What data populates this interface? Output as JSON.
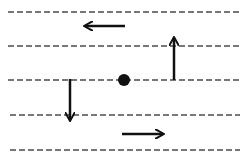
{
  "diagram": {
    "lines": [
      {
        "y": 12,
        "x1": 8,
        "x2": 240
      },
      {
        "y": 46,
        "x1": 8,
        "x2": 240
      },
      {
        "y": 80,
        "x1": 8,
        "x2": 240
      },
      {
        "y": 115,
        "x1": 10,
        "x2": 240
      },
      {
        "y": 150,
        "x1": 10,
        "x2": 240
      }
    ],
    "arrows": [
      {
        "direction": "left",
        "x1": 125,
        "y1": 26,
        "x2": 85,
        "y2": 26
      },
      {
        "direction": "up",
        "x1": 174,
        "y1": 80,
        "x2": 174,
        "y2": 38
      },
      {
        "direction": "down",
        "x1": 70,
        "y1": 79,
        "x2": 70,
        "y2": 120
      },
      {
        "direction": "right",
        "x1": 122,
        "y1": 134,
        "x2": 163,
        "y2": 134
      }
    ],
    "dot": {
      "cx": 124,
      "cy": 80,
      "r": 6
    },
    "colors": {
      "line": "#777777",
      "ink": "#111111"
    }
  }
}
